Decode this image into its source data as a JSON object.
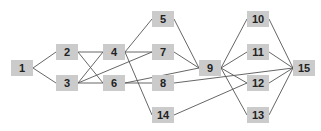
{
  "diagram": {
    "type": "directed-graph",
    "node_color": "#cbcbcb",
    "edge_color": "#555555",
    "text_color": "#222222",
    "nodes": [
      {
        "id": "1",
        "label": "1",
        "x": 22,
        "y": 68
      },
      {
        "id": "2",
        "label": "2",
        "x": 67,
        "y": 52
      },
      {
        "id": "3",
        "label": "3",
        "x": 67,
        "y": 83
      },
      {
        "id": "4",
        "label": "4",
        "x": 114,
        "y": 52
      },
      {
        "id": "6",
        "label": "6",
        "x": 114,
        "y": 83
      },
      {
        "id": "5",
        "label": "5",
        "x": 163,
        "y": 19
      },
      {
        "id": "7",
        "label": "7",
        "x": 163,
        "y": 52
      },
      {
        "id": "8",
        "label": "8",
        "x": 163,
        "y": 83
      },
      {
        "id": "14",
        "label": "14",
        "x": 163,
        "y": 115
      },
      {
        "id": "9",
        "label": "9",
        "x": 210,
        "y": 68
      },
      {
        "id": "10",
        "label": "10",
        "x": 258,
        "y": 19
      },
      {
        "id": "11",
        "label": "11",
        "x": 258,
        "y": 52
      },
      {
        "id": "12",
        "label": "12",
        "x": 258,
        "y": 83
      },
      {
        "id": "13",
        "label": "13",
        "x": 258,
        "y": 115
      },
      {
        "id": "15",
        "label": "15",
        "x": 304,
        "y": 68
      }
    ],
    "edges": [
      [
        "1",
        "2"
      ],
      [
        "1",
        "3"
      ],
      [
        "2",
        "4"
      ],
      [
        "2",
        "6"
      ],
      [
        "3",
        "4"
      ],
      [
        "3",
        "6"
      ],
      [
        "3",
        "7"
      ],
      [
        "4",
        "5"
      ],
      [
        "4",
        "7"
      ],
      [
        "4",
        "14"
      ],
      [
        "6",
        "8"
      ],
      [
        "6",
        "9"
      ],
      [
        "5",
        "9"
      ],
      [
        "7",
        "9"
      ],
      [
        "8",
        "15"
      ],
      [
        "14",
        "12"
      ],
      [
        "9",
        "10"
      ],
      [
        "9",
        "11"
      ],
      [
        "9",
        "12"
      ],
      [
        "9",
        "13"
      ],
      [
        "10",
        "15"
      ],
      [
        "11",
        "15"
      ],
      [
        "12",
        "15"
      ],
      [
        "13",
        "15"
      ]
    ]
  }
}
